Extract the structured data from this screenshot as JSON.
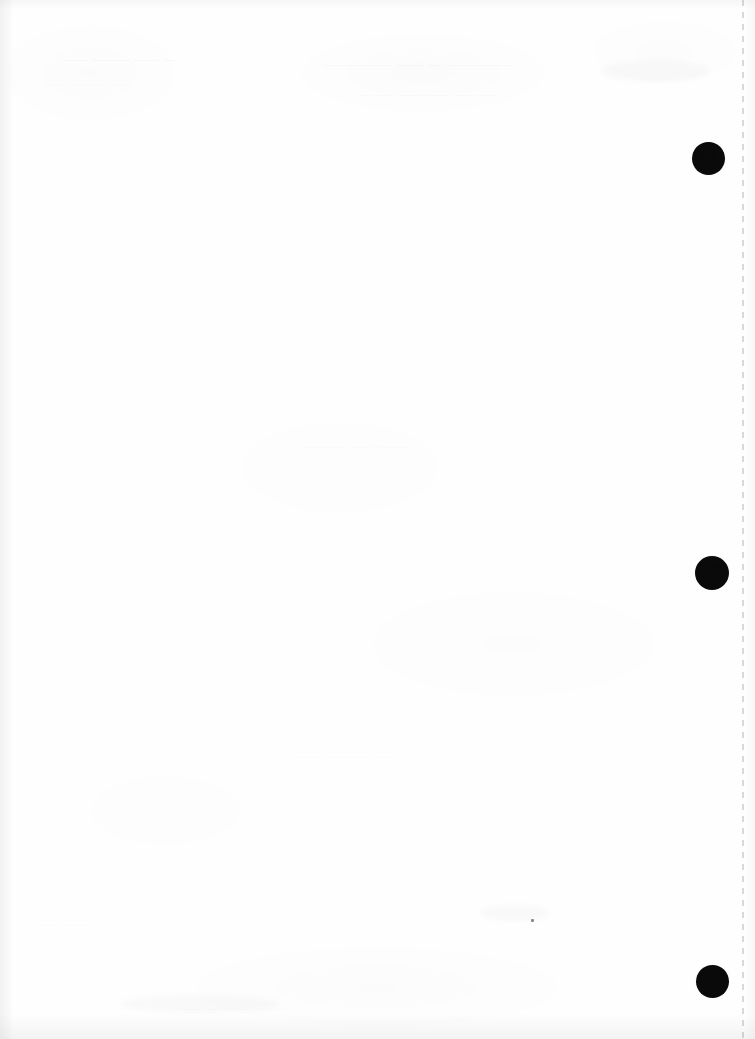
{
  "document": {
    "title": "Scanned blank page",
    "page_width": 755,
    "page_height": 1039,
    "background_color": "#fefefe",
    "content_summary": "Blank scanned sheet with three black punch-hole marks in the right margin and a dashed perforation line at the far right edge.",
    "visible_text": ""
  },
  "perforation": {
    "name": "dashed perforation line",
    "orientation": "vertical",
    "x": 742,
    "top": 0,
    "bottom": 1039,
    "color": "#d2d2d2",
    "dash_length": 6,
    "gap_length": 6
  },
  "punch_holes": {
    "count": 3,
    "color": "#0a0a0a",
    "items": [
      {
        "label": "top punch hole",
        "cx": 708,
        "cy": 159,
        "diameter": 33
      },
      {
        "label": "middle punch hole",
        "cx": 712,
        "cy": 573,
        "diameter": 34
      },
      {
        "label": "bottom punch hole",
        "cx": 712,
        "cy": 981,
        "diameter": 33
      }
    ]
  },
  "artifacts": {
    "ghost_text_note": "Illegible bleed-through from the reverse side of the sheet",
    "ghost_blocks": [
      {
        "label": "ghost heading upper-left",
        "text": "— —— ——— ——",
        "x": 62,
        "y": 52,
        "size": 12
      },
      {
        "label": "ghost heading upper-center",
        "text": "————— — —— —————",
        "x": 322,
        "y": 56,
        "size": 13
      },
      {
        "label": "ghost line upper-center",
        "text": "———— —— —— ———",
        "x": 360,
        "y": 88,
        "size": 11
      },
      {
        "label": "ghost line left",
        "text": "—— ——— ——",
        "x": 44,
        "y": 78,
        "size": 11
      },
      {
        "label": "ghost line mid-page",
        "text": "——— —— ————",
        "x": 300,
        "y": 440,
        "size": 11
      },
      {
        "label": "ghost line lower-mid",
        "text": "—— ———— ——",
        "x": 295,
        "y": 750,
        "size": 11
      },
      {
        "label": "ghost line bottom-left",
        "text": "—— ——",
        "x": 36,
        "y": 918,
        "size": 11
      },
      {
        "label": "ghost line bottom-center",
        "text": "——— ———— ——",
        "x": 176,
        "y": 1002,
        "size": 11
      }
    ],
    "specks": [
      {
        "label": "ink speck",
        "x": 531,
        "y": 919,
        "w": 3,
        "h": 3
      }
    ],
    "smudges": [
      {
        "label": "smudge mid-right",
        "x": 480,
        "y": 905,
        "w": 70,
        "h": 16
      },
      {
        "label": "smudge lower-left",
        "x": 120,
        "y": 995,
        "w": 160,
        "h": 18
      },
      {
        "label": "smudge upper-right",
        "x": 600,
        "y": 60,
        "w": 110,
        "h": 22
      }
    ]
  }
}
